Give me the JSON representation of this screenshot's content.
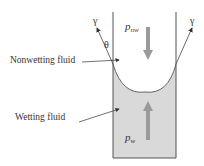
{
  "diagram": {
    "type": "capillary-meniscus",
    "labels": {
      "nonwetting": "Nonwetting fluid",
      "wetting": "Wetting fluid",
      "gamma_left": "γ",
      "gamma_right": "γ",
      "theta": "θ",
      "p_nw_main": "p",
      "p_nw_sub": "nw",
      "p_w_main": "p",
      "p_w_sub": "w"
    },
    "colors": {
      "wall": "#555555",
      "wetting_fill": "#d8d8d8",
      "pressure_arrow": "#999999",
      "line": "#444444"
    }
  }
}
